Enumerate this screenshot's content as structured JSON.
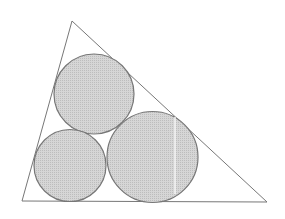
{
  "diagram": {
    "canvas": {
      "width": 285,
      "height": 219,
      "background": "#ffffff"
    },
    "colors": {
      "stroke": "#777777",
      "fill": "#d6d6d6",
      "fill_dot": "#bdbdbd",
      "highlight": "#f4f4f4"
    },
    "triangle": {
      "vertices": [
        {
          "name": "top",
          "x": 72,
          "y": 21
        },
        {
          "name": "bottom-left",
          "x": 22,
          "y": 201
        },
        {
          "name": "bottom-right",
          "x": 267,
          "y": 202
        }
      ]
    },
    "circles": [
      {
        "name": "top-circle",
        "cx": 94,
        "cy": 94,
        "r": 40
      },
      {
        "name": "bottom-left-circle",
        "cx": 70,
        "cy": 165.5,
        "r": 36
      },
      {
        "name": "bottom-right-circle",
        "cx": 152.5,
        "cy": 157,
        "r": 45.5
      }
    ],
    "highlight_line": {
      "x1": 175,
      "y1": 117,
      "x2": 175,
      "y2": 194
    }
  }
}
